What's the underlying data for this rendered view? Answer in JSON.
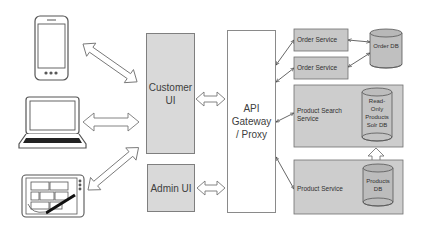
{
  "diagram": {
    "type": "architecture",
    "clients": [
      {
        "name": "smartphone",
        "icon": "smartphone-icon"
      },
      {
        "name": "laptop",
        "icon": "laptop-icon"
      },
      {
        "name": "tablet",
        "icon": "tablet-icon"
      }
    ],
    "frontends": {
      "customer_ui": {
        "line1": "Customer",
        "line2": "UI"
      },
      "admin_ui": {
        "label": "Admin UI"
      }
    },
    "gateway": {
      "line1": "API",
      "line2": "Gateway",
      "line3": "/ Proxy"
    },
    "services": {
      "order_service_1": {
        "label": "Order Service"
      },
      "order_service_2": {
        "label": "Order Service"
      },
      "product_search": {
        "line1": "Product Search",
        "line2": "Service"
      },
      "product_service": {
        "label": "Product Service"
      }
    },
    "databases": {
      "order_db": {
        "label": "Order DB"
      },
      "solr_db": {
        "line1": "Read-",
        "line2": "Only",
        "line3": "Products",
        "line4": "Solr DB"
      },
      "products_db": {
        "line1": "Products",
        "line2": "DB"
      }
    },
    "connections": [
      {
        "from": "smartphone",
        "to": "Customer UI",
        "style": "double-block-arrow"
      },
      {
        "from": "laptop",
        "to": "Customer UI",
        "style": "double-block-arrow"
      },
      {
        "from": "tablet",
        "to": "Customer UI",
        "style": "double-block-arrow"
      },
      {
        "from": "Customer UI",
        "to": "API Gateway / Proxy",
        "style": "double-block-arrow"
      },
      {
        "from": "Admin UI",
        "to": "API Gateway / Proxy",
        "style": "double-block-arrow"
      },
      {
        "from": "API Gateway / Proxy",
        "to": "Order Service",
        "style": "double-line-arrow"
      },
      {
        "from": "API Gateway / Proxy",
        "to": "Order Service",
        "style": "double-line-arrow"
      },
      {
        "from": "API Gateway / Proxy",
        "to": "Product Search Service",
        "style": "double-line-arrow"
      },
      {
        "from": "API Gateway / Proxy",
        "to": "Product Service",
        "style": "double-line-arrow"
      },
      {
        "from": "Order Service",
        "to": "Order DB",
        "style": "double-line-arrow"
      },
      {
        "from": "Order Service",
        "to": "Order DB",
        "style": "double-line-arrow"
      },
      {
        "from": "Products DB",
        "to": "Read-Only Products Solr DB",
        "style": "block-arrow-up"
      }
    ]
  }
}
